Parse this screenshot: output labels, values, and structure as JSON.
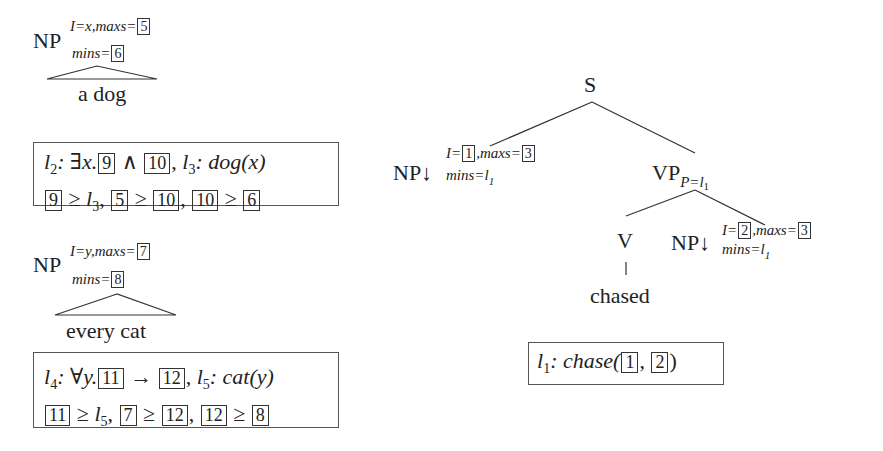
{
  "np_a_dog": {
    "cat": "NP",
    "sup_I": "I=x,",
    "sup_maxs": "maxs=",
    "maxs_box": "5",
    "mins_label": "mins=",
    "mins_box": "6",
    "yield": "a dog",
    "formula": {
      "line1": {
        "l2": "l",
        "l2_sub": "2",
        "sep1": ": ∃x.",
        "box_a": "9",
        "and": " ∧ ",
        "box_b": "10",
        "comma": ", ",
        "l3": "l",
        "l3_sub": "3",
        "pred": ": dog(x)"
      },
      "line2": {
        "b1": "9",
        "ge1": " ≥ ",
        "l": "l",
        "l_sub": "3",
        "c1": ", ",
        "b2": "5",
        "ge2": " ≥ ",
        "b3": "10",
        "c2": ", ",
        "b4": "10",
        "ge3": " ≥ ",
        "b5": "6"
      }
    }
  },
  "np_every_cat": {
    "cat": "NP",
    "sup_I": "I=y,",
    "sup_maxs": "maxs=",
    "maxs_box": "7",
    "mins_label": "mins=",
    "mins_box": "8",
    "yield": "every cat",
    "formula": {
      "line1": {
        "l4": "l",
        "l4_sub": "4",
        "sep1": ": ∀y.",
        "box_a": "11",
        "arrow": " → ",
        "box_b": "12",
        "comma": ", ",
        "l5": "l",
        "l5_sub": "5",
        "pred": ": cat(y)"
      },
      "line2": {
        "b1": "11",
        "ge1": " ≥ ",
        "l": "l",
        "l_sub": "5",
        "c1": ", ",
        "b2": "7",
        "ge2": " ≥ ",
        "b3": "12",
        "c2": ", ",
        "b4": "12",
        "ge3": " ≥ ",
        "b5": "8"
      }
    }
  },
  "tree_chased": {
    "root": "S",
    "subj": {
      "cat": "NP↓",
      "sup_I": "I=",
      "I_box": "1",
      "sup_maxs": ",maxs=",
      "maxs_box": "3",
      "mins": "mins=l",
      "mins_sub": "1"
    },
    "vp": {
      "cat": "VP",
      "sub": "P=l",
      "sub_sub": "1"
    },
    "verb": {
      "cat": "V",
      "anchor": "chased"
    },
    "obj": {
      "cat": "NP↓",
      "sup_I": "I=",
      "I_box": "2",
      "sup_maxs": ",maxs=",
      "maxs_box": "3",
      "mins": "mins=l",
      "mins_sub": "1"
    },
    "formula": {
      "l1": "l",
      "l1_sub": "1",
      "pred": ": chase(",
      "box_a": "1",
      "comma": ", ",
      "box_b": "2",
      "close": ")"
    }
  }
}
